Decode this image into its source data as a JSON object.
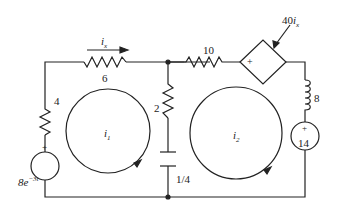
{
  "diagram": {
    "type": "circuit",
    "components": {
      "r_left": {
        "label": "4",
        "type": "resistor"
      },
      "r_top_left": {
        "label": "6",
        "type": "resistor"
      },
      "r_mid": {
        "label": "2",
        "type": "resistor"
      },
      "c_mid": {
        "label": "1/4",
        "type": "capacitor"
      },
      "r_top_right": {
        "label": "10",
        "type": "resistor"
      },
      "dep_source": {
        "label_coef": "40",
        "label_var": "i",
        "label_sub": "x",
        "sign": "+",
        "type": "dependent-voltage-source"
      },
      "inductor": {
        "label": "8",
        "type": "inductor"
      },
      "v_left": {
        "sign": "+",
        "label_coef": "8e",
        "label_exp": "−3t",
        "type": "voltage-source"
      },
      "v_right": {
        "sign": "+",
        "label": "14",
        "type": "voltage-source"
      }
    },
    "currents": {
      "ix": {
        "var": "i",
        "sub": "x"
      },
      "i1": {
        "var": "i",
        "sub": "1"
      },
      "i2": {
        "var": "i",
        "sub": "2"
      }
    }
  }
}
